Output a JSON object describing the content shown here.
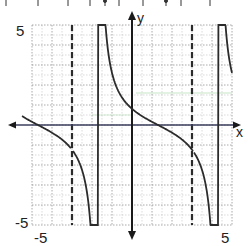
{
  "chart_data": {
    "type": "line",
    "title": "",
    "xlabel": "x",
    "ylabel": "y",
    "xlim": [
      -5,
      5
    ],
    "ylim": [
      -5,
      5
    ],
    "grid": true,
    "grid_minor_step": 0.5,
    "tick_labels": {
      "x": [
        {
          "value": -5,
          "label": "-5"
        },
        {
          "value": 5,
          "label": "5"
        }
      ],
      "y": [
        {
          "value": 5,
          "label": "5"
        },
        {
          "value": -5,
          "label": "-5"
        }
      ]
    },
    "asymptotes": [
      -3,
      3
    ],
    "function": "y = -tan(pi*(x - 1.3)/6)",
    "function_params": {
      "amplitude": 1.0,
      "period": 6,
      "shift": 1.3,
      "sign": -1
    },
    "series": [
      {
        "name": "branch-left",
        "x": [
          -5.5,
          -5.0,
          -4.5,
          -4.0,
          -3.6,
          -3.3,
          -3.1
        ],
        "y": [
          0.96,
          0.57,
          0.11,
          -0.42,
          -1.07,
          -1.8,
          -4.9
        ]
      },
      {
        "name": "branch-middle",
        "x": [
          -2.8,
          -2.4,
          -2.0,
          -1.0,
          0.0,
          1.0,
          2.0,
          3.0,
          3.2,
          3.3
        ],
        "y": [
          5.0,
          3.6,
          2.3,
          0.93,
          0.38,
          0.0,
          -0.34,
          -0.73,
          -4.0,
          -5.0
        ]
      },
      {
        "name": "branch-right",
        "x": [
          3.2,
          3.5,
          4.0,
          4.5,
          5.0
        ],
        "y": [
          5.0,
          3.0,
          1.6,
          0.4,
          -0.3
        ]
      }
    ],
    "top_ticks_visible": true
  },
  "labels": {
    "x_axis": "x",
    "y_axis": "y",
    "x_min": "-5",
    "x_max": "5",
    "y_max": "5",
    "y_min": "-5"
  },
  "colors": {
    "curve": "#2b2b2b",
    "axis": "#1a1a1a",
    "x_axis_tint": "#3b3f5c",
    "grid": "#8a8a8a",
    "asymptote": "#2b2b2b",
    "faint_green": "#b9e0b9"
  }
}
